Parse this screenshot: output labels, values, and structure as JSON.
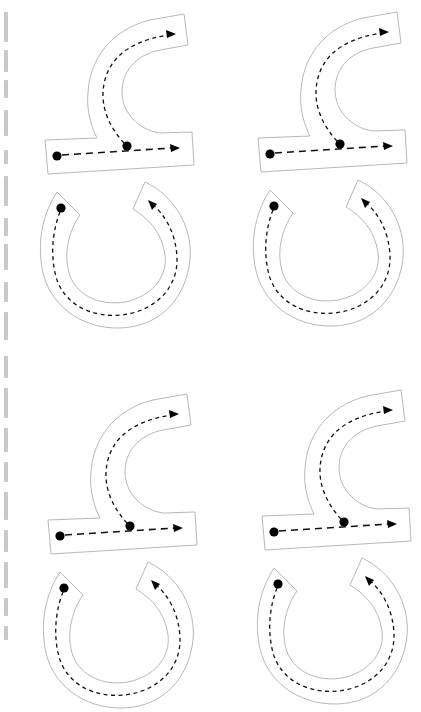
{
  "worksheet": {
    "description": "Letter tracing practice sheet (rotated 90°)",
    "glyph_count": 4,
    "layout": "2x2 grid",
    "colors": {
      "background": "#ffffff",
      "outline": "#b8b8b8",
      "guide": "#111111",
      "start_dot": "#000000"
    },
    "glyphs": [
      {
        "id": "top-left",
        "dx": 0,
        "dy": 0
      },
      {
        "id": "top-right",
        "dx": 213,
        "dy": -2
      },
      {
        "id": "bottom-left",
        "dx": 3,
        "dy": 380
      },
      {
        "id": "bottom-right",
        "dx": 217,
        "dy": 376
      }
    ],
    "strokes_per_glyph": [
      {
        "name": "bar-stroke",
        "style": "long-dash",
        "direction": "left-to-right"
      },
      {
        "name": "hook-stroke",
        "style": "short-dash",
        "direction": "up-and-right"
      },
      {
        "name": "bowl-stroke",
        "style": "short-dash",
        "direction": "down-around-up"
      }
    ],
    "edge_text": {
      "visible": true,
      "legible": false
    }
  }
}
